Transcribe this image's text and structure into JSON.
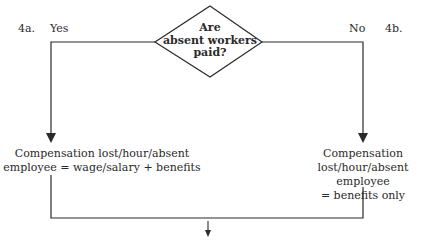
{
  "decision": {
    "question_lines": [
      "Are",
      "absent workers",
      "paid?"
    ]
  },
  "branches": {
    "left": {
      "number": "4a.",
      "answer": "Yes",
      "result_lines": [
        "Compensation lost/hour/absent",
        "employee = wage/salary + benefits"
      ]
    },
    "right": {
      "number": "4b.",
      "answer": "No",
      "result_lines": [
        "Compensation",
        "lost/hour/absent employee",
        "= benefits only"
      ]
    }
  },
  "colors": {
    "line": "#2a2a2a",
    "background": "#ffffff"
  }
}
